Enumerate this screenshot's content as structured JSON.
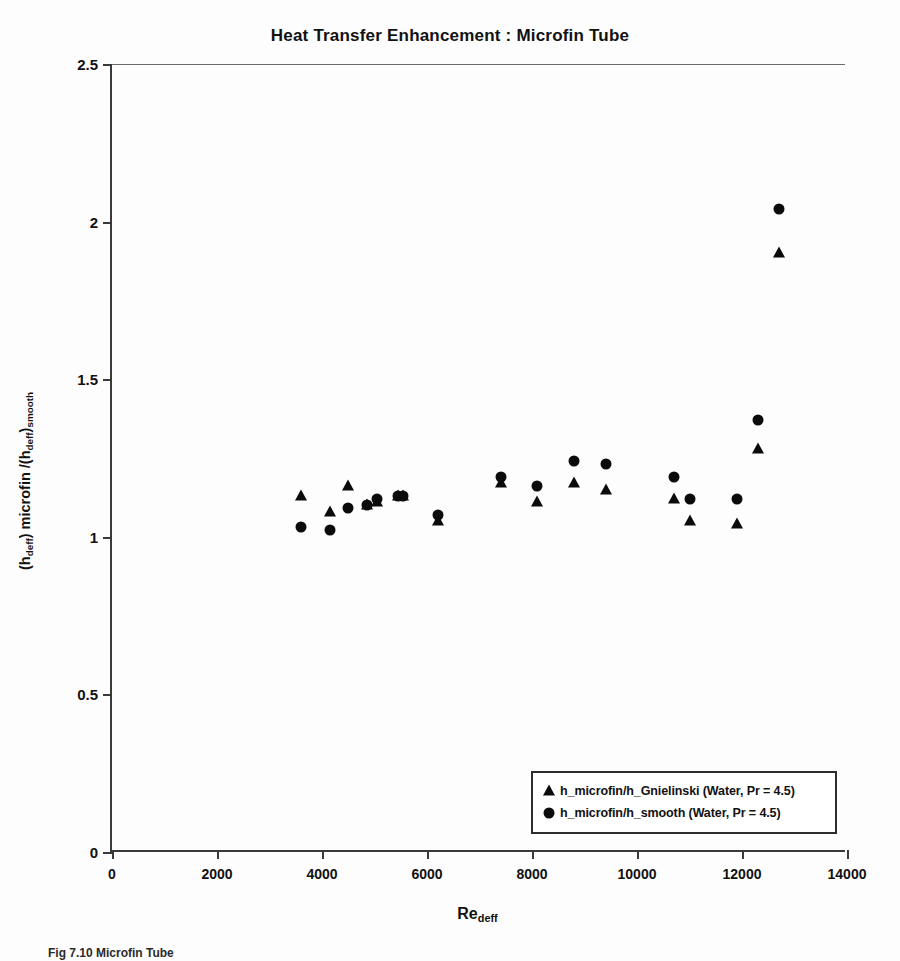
{
  "figure": {
    "title": "Heat Transfer Enhancement : Microfin Tube",
    "caption": "Fig 7.10  Microfin Tube"
  },
  "axes": {
    "x": {
      "label_main": "Re",
      "label_sub": "deff",
      "ticks": [
        0,
        2000,
        4000,
        6000,
        8000,
        10000,
        12000,
        14000
      ],
      "tick_labels": [
        "0",
        "2000",
        "4000",
        "6000",
        "8000",
        "10000",
        "12000",
        "14000"
      ],
      "min": 0,
      "max": 14000
    },
    "y": {
      "label_parts": {
        "p1": "(h",
        "sub1": "deff",
        "p2": ")",
        "p3": " microfin",
        "p4": " /(h",
        "sub2": "deff",
        "p5": ")",
        "sub3": "smooth"
      },
      "ticks": [
        0,
        0.5,
        1,
        1.5,
        2,
        2.5
      ],
      "tick_labels": [
        "0",
        "0.5",
        "1",
        "1.5",
        "2",
        "2.5"
      ],
      "min": 0,
      "max": 2.5
    }
  },
  "legend": {
    "position": "bottom-right",
    "entries": [
      {
        "marker": "triangle",
        "label": "h_microfin/h_Gnielinski (Water, Pr = 4.5)"
      },
      {
        "marker": "circle",
        "label": "h_microfin/h_smooth (Water, Pr = 4.5)"
      }
    ]
  },
  "colors": {
    "marker": "#0b0b0b",
    "axis": "#3a3a3a",
    "background": "#fdfdfd",
    "legend_border": "#2e2e2e"
  },
  "chart_data": {
    "type": "scatter",
    "title": "Heat Transfer Enhancement : Microfin Tube",
    "xlabel": "Re_deff",
    "ylabel": "(h_deff)_microfin / (h_deff)_smooth",
    "xlim": [
      0,
      14000
    ],
    "ylim": [
      0,
      2.5
    ],
    "grid": false,
    "legend_position": "lower right",
    "series": [
      {
        "name": "h_microfin/h_Gnielinski (Water, Pr = 4.5)",
        "marker": "triangle",
        "points": [
          {
            "x": 3600,
            "y": 1.13
          },
          {
            "x": 4150,
            "y": 1.08
          },
          {
            "x": 4500,
            "y": 1.16
          },
          {
            "x": 4850,
            "y": 1.1
          },
          {
            "x": 5050,
            "y": 1.11
          },
          {
            "x": 5450,
            "y": 1.13
          },
          {
            "x": 5550,
            "y": 1.13
          },
          {
            "x": 6200,
            "y": 1.05
          },
          {
            "x": 7400,
            "y": 1.17
          },
          {
            "x": 8100,
            "y": 1.11
          },
          {
            "x": 8800,
            "y": 1.17
          },
          {
            "x": 9400,
            "y": 1.15
          },
          {
            "x": 10700,
            "y": 1.12
          },
          {
            "x": 11000,
            "y": 1.05
          },
          {
            "x": 11900,
            "y": 1.04
          },
          {
            "x": 12300,
            "y": 1.28
          },
          {
            "x": 12700,
            "y": 1.9
          }
        ]
      },
      {
        "name": "h_microfin/h_smooth (Water, Pr = 4.5)",
        "marker": "circle",
        "points": [
          {
            "x": 3600,
            "y": 1.03
          },
          {
            "x": 4150,
            "y": 1.02
          },
          {
            "x": 4500,
            "y": 1.09
          },
          {
            "x": 4850,
            "y": 1.1
          },
          {
            "x": 5050,
            "y": 1.12
          },
          {
            "x": 5450,
            "y": 1.13
          },
          {
            "x": 5550,
            "y": 1.13
          },
          {
            "x": 6200,
            "y": 1.07
          },
          {
            "x": 7400,
            "y": 1.19
          },
          {
            "x": 8100,
            "y": 1.16
          },
          {
            "x": 8800,
            "y": 1.24
          },
          {
            "x": 9400,
            "y": 1.23
          },
          {
            "x": 10700,
            "y": 1.19
          },
          {
            "x": 11000,
            "y": 1.12
          },
          {
            "x": 11900,
            "y": 1.12
          },
          {
            "x": 12300,
            "y": 1.37
          },
          {
            "x": 12700,
            "y": 2.04
          }
        ]
      }
    ]
  }
}
